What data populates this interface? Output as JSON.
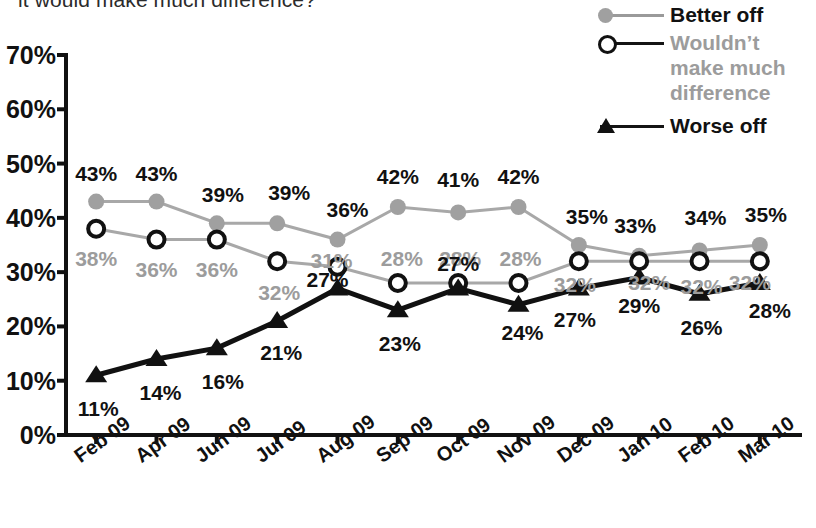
{
  "title": "it would make much difference?",
  "legend": {
    "items": [
      {
        "label": "Better off",
        "marker": "filled-circle-icon",
        "color": "#a0a0a0",
        "text_color": "#111111"
      },
      {
        "label": "Wouldn’t make much difference",
        "marker": "open-circle-icon",
        "color": "#111111",
        "text_color": "#9c9c9c"
      },
      {
        "label": "Worse off",
        "marker": "triangle-icon",
        "color": "#111111",
        "text_color": "#111111"
      }
    ]
  },
  "axis": {
    "y_ticks": [
      "0%",
      "10%",
      "20%",
      "30%",
      "40%",
      "50%",
      "60%",
      "70%"
    ],
    "x_ticks": [
      "Feb 09",
      "Apr 09",
      "Jun 09",
      "Jul 09",
      "Aug 09",
      "Sep 09",
      "Oct 09",
      "Nov 09",
      "Dec 09",
      "Jan 10",
      "Feb 10",
      "Mar 10"
    ]
  },
  "chart_data": {
    "type": "line",
    "title": "it would make much difference?",
    "xlabel": "",
    "ylabel": "",
    "ylim": [
      0,
      70
    ],
    "grid": false,
    "legend_position": "top-right",
    "categories": [
      "Feb 09",
      "Apr 09",
      "Jun 09",
      "Jul 09",
      "Aug 09",
      "Sep 09",
      "Oct 09",
      "Nov 09",
      "Dec 09",
      "Jan 10",
      "Feb 10",
      "Mar 10"
    ],
    "series": [
      {
        "name": "Better off",
        "color": "#a0a0a0",
        "marker": "filled-circle",
        "values": [
          43,
          43,
          39,
          39,
          36,
          42,
          41,
          42,
          35,
          33,
          34,
          35
        ],
        "labels": [
          "43%",
          "43%",
          "39%",
          "39%",
          "36%",
          "42%",
          "41%",
          "42%",
          "35%",
          "33%",
          "34%",
          "35%"
        ]
      },
      {
        "name": "Wouldn’t make much difference",
        "color": "#9c9c9c",
        "marker": "open-circle",
        "values": [
          38,
          36,
          36,
          32,
          31,
          28,
          28,
          28,
          32,
          32,
          32,
          32
        ],
        "labels": [
          "38%",
          "36%",
          "36%",
          "32%",
          "31%",
          "28%",
          "28%",
          "28%",
          "32%",
          "32%",
          "32%",
          "32%"
        ]
      },
      {
        "name": "Worse off",
        "color": "#111111",
        "marker": "triangle",
        "values": [
          11,
          14,
          16,
          21,
          27,
          23,
          27,
          24,
          27,
          29,
          26,
          28
        ],
        "labels": [
          "11%",
          "14%",
          "16%",
          "21%",
          "27%",
          "23%",
          "27%",
          "24%",
          "27%",
          "29%",
          "26%",
          "28%"
        ]
      }
    ]
  },
  "label_offsets": {
    "better": [
      [
        0,
        -28
      ],
      [
        0,
        -28
      ],
      [
        6,
        -28
      ],
      [
        12,
        -30
      ],
      [
        10,
        -30
      ],
      [
        0,
        -30
      ],
      [
        0,
        -32
      ],
      [
        0,
        -30
      ],
      [
        8,
        -28
      ],
      [
        -4,
        -30
      ],
      [
        6,
        -32
      ],
      [
        6,
        -30
      ]
    ],
    "wouldnt": [
      [
        0,
        30
      ],
      [
        0,
        30
      ],
      [
        0,
        30
      ],
      [
        2,
        32
      ],
      [
        -6,
        -6
      ],
      [
        4,
        -24
      ],
      [
        2,
        -24
      ],
      [
        2,
        -24
      ],
      [
        -4,
        24
      ],
      [
        10,
        22
      ],
      [
        2,
        26
      ],
      [
        -10,
        22
      ]
    ],
    "worse": [
      [
        2,
        34
      ],
      [
        4,
        34
      ],
      [
        6,
        34
      ],
      [
        4,
        32
      ],
      [
        -10,
        -8
      ],
      [
        2,
        34
      ],
      [
        0,
        -24
      ],
      [
        4,
        28
      ],
      [
        -4,
        32
      ],
      [
        0,
        28
      ],
      [
        2,
        34
      ],
      [
        10,
        28
      ]
    ]
  }
}
